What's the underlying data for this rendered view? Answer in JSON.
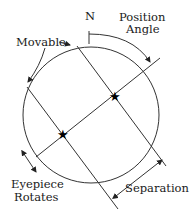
{
  "diagram": {
    "labels": {
      "north": "N",
      "position_angle_line1": "Position",
      "position_angle_line2": "Angle",
      "movable": "Movable",
      "eyepiece_line1": "Eyepiece",
      "eyepiece_line2": "Rotates",
      "separation": "Separation"
    },
    "icons": {
      "star_primary": "star-icon",
      "star_secondary": "star-icon"
    },
    "colors": {
      "stroke": "#333333",
      "text": "#1a1a1a",
      "background": "#ffffff"
    }
  }
}
